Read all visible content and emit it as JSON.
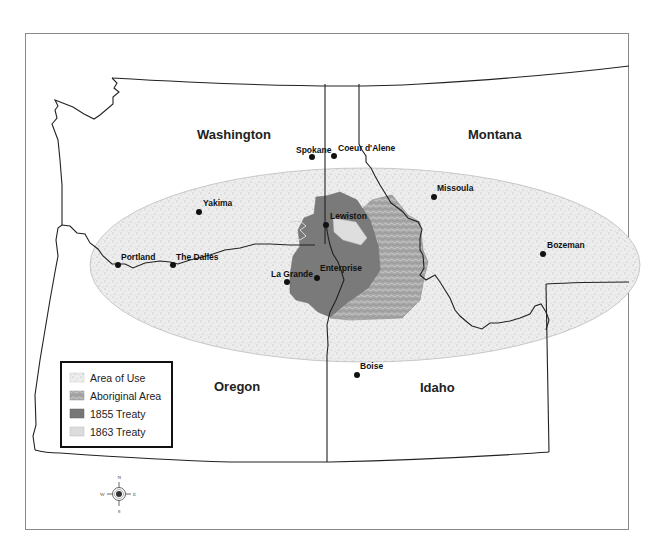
{
  "map": {
    "frame": {
      "x": 25,
      "y": 33,
      "width": 604,
      "height": 497
    },
    "states": [
      {
        "name": "Washington",
        "x": 197,
        "y": 139
      },
      {
        "name": "Montana",
        "x": 468,
        "y": 139
      },
      {
        "name": "Oregon",
        "x": 214,
        "y": 391
      },
      {
        "name": "Idaho",
        "x": 420,
        "y": 392
      }
    ],
    "cities": [
      {
        "name": "Spokane",
        "dot": [
          312,
          157
        ],
        "label": [
          296,
          153
        ]
      },
      {
        "name": "Coeur d'Alene",
        "dot": [
          334,
          156
        ],
        "label": [
          338,
          151
        ]
      },
      {
        "name": "Missoula",
        "dot": [
          434,
          197
        ],
        "label": [
          437,
          191
        ]
      },
      {
        "name": "Yakima",
        "dot": [
          199,
          212
        ],
        "label": [
          203,
          206
        ]
      },
      {
        "name": "Lewiston",
        "dot": [
          326,
          225
        ],
        "label": [
          330,
          219
        ]
      },
      {
        "name": "Bozeman",
        "dot": [
          543,
          254
        ],
        "label": [
          547,
          248
        ]
      },
      {
        "name": "Portland",
        "dot": [
          118,
          265
        ],
        "label": [
          121,
          260
        ]
      },
      {
        "name": "The Dalles",
        "dot": [
          173,
          265
        ],
        "label": [
          176,
          260
        ]
      },
      {
        "name": "Enterprise",
        "dot": [
          317,
          278
        ],
        "label": [
          320,
          271
        ]
      },
      {
        "name": "La Grande",
        "dot": [
          287,
          282
        ],
        "label": [
          271,
          277
        ]
      },
      {
        "name": "Boise",
        "dot": [
          357,
          375
        ],
        "label": [
          360,
          369
        ]
      }
    ],
    "legend": {
      "items": [
        {
          "label": "Area of Use",
          "swatch": "#f1f1f1"
        },
        {
          "label": "Aboriginal Area",
          "swatch": "#a9a9a9"
        },
        {
          "label": "1855 Treaty",
          "swatch": "#777777"
        },
        {
          "label": "1863 Treaty",
          "swatch": "#dcdcdc"
        }
      ]
    },
    "compass": {
      "n": "N",
      "s": "S",
      "e": "E",
      "w": "W"
    },
    "colors": {
      "area_of_use": "#ececec",
      "aboriginal_area": "#ababab",
      "treaty_1855": "#7a7a7a",
      "treaty_1863": "#dedede",
      "border": "#222222"
    }
  }
}
